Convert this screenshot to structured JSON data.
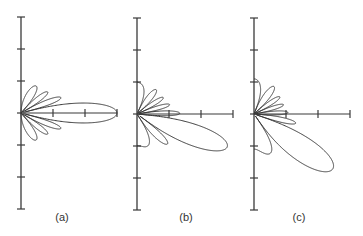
{
  "chart_data": [
    {
      "type": "polar-line",
      "label": "(a)",
      "description": "Array-factor radiation pattern, main lobe steered to 0°",
      "steer_deg": 0,
      "num_elements": 8,
      "axis": {
        "origin_x": 21,
        "origin_y": 113,
        "tick_spacing": 32,
        "x_ticks": 3,
        "y_ticks_up": 3,
        "y_ticks_down": 3
      },
      "main_lobe_length_ticks": 3
    },
    {
      "type": "polar-line",
      "label": "(b)",
      "description": "Array-factor radiation pattern, main lobe steered to about -20°",
      "steer_deg": -20,
      "num_elements": 8,
      "axis": {
        "origin_x": 137,
        "origin_y": 114,
        "tick_spacing": 32,
        "x_ticks": 3,
        "y_ticks_up": 3,
        "y_ticks_down": 3
      },
      "main_lobe_length_ticks": 3
    },
    {
      "type": "polar-line",
      "label": "(c)",
      "description": "Array-factor radiation pattern, main lobe steered to about -35°",
      "steer_deg": -35,
      "num_elements": 8,
      "axis": {
        "origin_x": 254,
        "origin_y": 114,
        "tick_spacing": 32,
        "x_ticks": 3,
        "y_ticks_up": 3,
        "y_ticks_down": 3
      },
      "main_lobe_length_ticks": 3
    }
  ],
  "labels": {
    "a": "(a)",
    "b": "(b)",
    "c": "(c)"
  },
  "colors": {
    "line": "#3a3a3a",
    "axis": "#3a3a3a",
    "background": "#ffffff"
  }
}
